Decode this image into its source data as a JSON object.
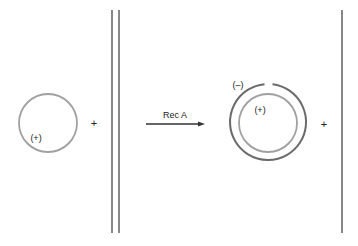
{
  "diagram": {
    "left": {
      "plasmid_label": "(+)",
      "operator": "+"
    },
    "reaction": {
      "label": "Rec A"
    },
    "right": {
      "outer_strand_label": "(–)",
      "inner_strand_label": "(+)",
      "operator": "+"
    },
    "colors": {
      "light_strand": "#a0a0a0",
      "dark_strand": "#6a6a6a",
      "arrow": "#333333",
      "text": "#222222"
    }
  }
}
